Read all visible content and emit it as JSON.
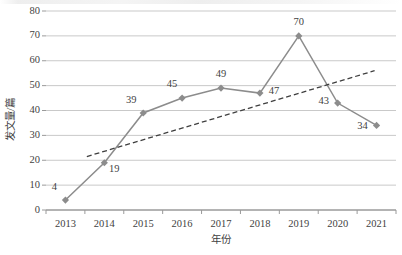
{
  "chart_data": {
    "type": "line",
    "title": "",
    "xlabel": "年份",
    "ylabel": "发文量/篇",
    "categories": [
      "2013",
      "2014",
      "2015",
      "2016",
      "2017",
      "2018",
      "2019",
      "2020",
      "2021"
    ],
    "values": [
      4,
      19,
      39,
      45,
      49,
      47,
      70,
      43,
      34
    ],
    "point_labels": [
      "4",
      "19",
      "39",
      "45",
      "49",
      "47",
      "70",
      "43",
      "34"
    ],
    "series": [
      {
        "name": "发文量/篇",
        "values": [
          4,
          19,
          39,
          45,
          49,
          47,
          70,
          43,
          34
        ],
        "marker": "diamond",
        "color": "#8c8c8c"
      },
      {
        "name": "趋势线",
        "type": "trendline",
        "style": "dashed",
        "color": "#3f3f3f",
        "start": {
          "x": 0.55,
          "y": 21.5
        },
        "end": {
          "x": 7.95,
          "y": 56.0
        }
      }
    ],
    "ylim": [
      0,
      80
    ],
    "yticks": [
      0,
      10,
      20,
      30,
      40,
      50,
      60,
      70,
      80
    ],
    "ytick_labels": [
      "0",
      "10",
      "20",
      "30",
      "40",
      "50",
      "60",
      "70",
      "80"
    ],
    "grid": "horizontal",
    "legend": "none",
    "colors": {
      "series_line": "#8c8c8c",
      "marker": "#8c8c8c",
      "trendline": "#3f3f3f",
      "gridline": "#c9c9c9",
      "axis": "#9a9a9a",
      "text": "#3f3f3f",
      "background": "#ffffff"
    }
  }
}
